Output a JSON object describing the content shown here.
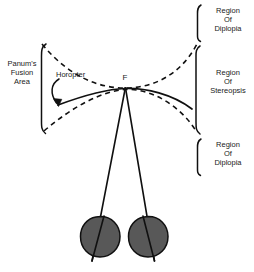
{
  "figure": {
    "labels": {
      "panum_fusion_area": "Panum's\nFusion\nArea",
      "panum_line1": "Panum's",
      "panum_line2": "Fusion",
      "panum_line3": "Area",
      "horopter": "Horopter",
      "fixation_point": "F",
      "region_of_diplopia_top_line1": "Region",
      "region_of_diplopia_top_line2": "Of",
      "region_of_diplopia_top_line3": "Diplopia",
      "region_of_stereopsis_line1": "Region",
      "region_of_stereopsis_line2": "Of",
      "region_of_stereopsis_line3": "Stereopsis",
      "region_of_diplopia_bottom_line1": "Region",
      "region_of_diplopia_bottom_line2": "Of",
      "region_of_diplopia_bottom_line3": "Diplopia"
    },
    "colors": {
      "background": "#ffffff",
      "stroke": "#101010",
      "text": "#1a1a1a",
      "eye_fill": "#585858",
      "eye_stroke": "#101010"
    },
    "elements": {
      "horopter_curve": "solid curve through fixation point F",
      "panum_upper_boundary": "dashed curve above horopter",
      "panum_lower_boundary": "dashed curve below horopter",
      "left_eye": "filled gray circle",
      "right_eye": "filled gray circle",
      "sight_line_left": "line from F to left eye",
      "sight_line_right": "line from F to right eye",
      "bracket_panum": "left square bracket",
      "bracket_diplopia_top": "right square bracket",
      "bracket_stereopsis": "right square bracket",
      "bracket_diplopia_bottom": "right square bracket",
      "horopter_arrow": "curved arrow from Horopter label to horopter curve"
    }
  }
}
